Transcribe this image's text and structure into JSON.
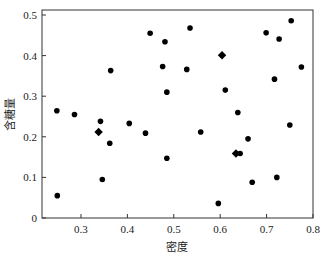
{
  "chart_data": {
    "type": "scatter",
    "title": "",
    "xlabel": "密度",
    "ylabel": "含糖量",
    "xlim": [
      0.216,
      0.8
    ],
    "ylim": [
      0,
      0.5
    ],
    "xticks": [
      0.3,
      0.4,
      0.5,
      0.6,
      0.7,
      0.8
    ],
    "xtick_labels": [
      "0.3",
      "0.4",
      "0.5",
      "0.6",
      "0.7",
      "0.8"
    ],
    "yticks": [
      0,
      0.1,
      0.2,
      0.3,
      0.4,
      0.5
    ],
    "ytick_labels": [
      "0",
      "0.1",
      "0.2",
      "0.3",
      "0.4",
      "0.5"
    ],
    "grid": false,
    "legend": null,
    "series": [
      {
        "name": "samples",
        "marker": "circle",
        "color": "#000000",
        "x": [
          0.248,
          0.286,
          0.342,
          0.362,
          0.404,
          0.346,
          0.249,
          0.364,
          0.449,
          0.535,
          0.481,
          0.476,
          0.528,
          0.485,
          0.611,
          0.439,
          0.558,
          0.485,
          0.596,
          0.753,
          0.699,
          0.727,
          0.775,
          0.717,
          0.638,
          0.75,
          0.66,
          0.643,
          0.669,
          0.722
        ],
        "y": [
          0.264,
          0.255,
          0.238,
          0.184,
          0.233,
          0.095,
          0.055,
          0.363,
          0.455,
          0.468,
          0.434,
          0.373,
          0.366,
          0.31,
          0.315,
          0.209,
          0.212,
          0.147,
          0.036,
          0.486,
          0.456,
          0.441,
          0.372,
          0.342,
          0.26,
          0.229,
          0.195,
          0.159,
          0.088,
          0.1
        ]
      },
      {
        "name": "centers",
        "marker": "diamond",
        "color": "#000000",
        "x": [
          0.338,
          0.604,
          0.634
        ],
        "y": [
          0.212,
          0.401,
          0.159
        ]
      }
    ]
  }
}
